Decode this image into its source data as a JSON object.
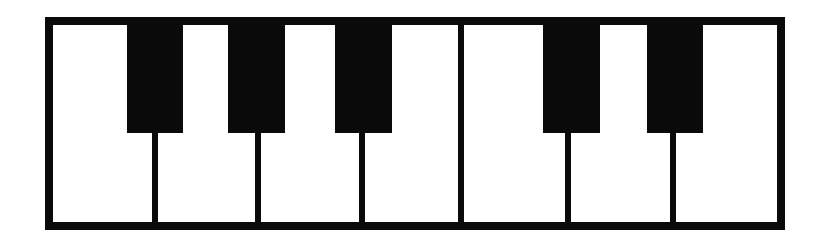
{
  "figure": {
    "name": "piano-keyboard-octave",
    "description": "Line drawing of one octave of a piano keyboard",
    "style": "black-and-white line art",
    "colors": {
      "key_black": "#0a0a0a",
      "key_white": "#ffffff",
      "background": "#ffffff"
    },
    "geometry": {
      "image_width": 820,
      "image_height": 243,
      "frame_left": 45,
      "frame_top": 17,
      "frame_width": 740,
      "frame_height": 213,
      "frame_border": 8,
      "inner_width": 724,
      "inner_height": 197,
      "black_key_height": 108,
      "divider_width": 6
    }
  },
  "keyboard": {
    "octave_count": 1,
    "white_key_count": 7,
    "black_key_count": 5,
    "white_keys": [
      {
        "note": "C",
        "left": 0,
        "width": 82,
        "label": "C"
      },
      {
        "note": "D",
        "left": 82,
        "width": 103,
        "label": "D"
      },
      {
        "note": "E",
        "left": 185,
        "width": 104,
        "label": "E"
      },
      {
        "note": "F",
        "left": 289,
        "width": 119,
        "label": "F"
      },
      {
        "note": "G",
        "left": 408,
        "width": 104,
        "label": "G"
      },
      {
        "note": "A",
        "left": 512,
        "width": 105,
        "label": "A"
      },
      {
        "note": "B",
        "left": 617,
        "width": 107,
        "label": "B"
      }
    ],
    "black_keys": [
      {
        "note": "C#",
        "left": 74,
        "width": 56,
        "label": "C♯/D♭"
      },
      {
        "note": "D#",
        "left": 175,
        "width": 57,
        "label": "D♯/E♭"
      },
      {
        "note": "F#",
        "left": 282,
        "width": 57,
        "label": "F♯/G♭"
      },
      {
        "note": "G#",
        "left": 490,
        "width": 57,
        "label": "G♯/A♭"
      },
      {
        "note": "A#",
        "left": 594,
        "width": 56,
        "label": "A♯/B♭"
      }
    ],
    "dividers": [
      {
        "between": "C-D",
        "left": 99,
        "type": "short"
      },
      {
        "between": "D-E",
        "left": 202,
        "type": "short"
      },
      {
        "between": "E-F",
        "left": 306,
        "type": "short"
      },
      {
        "between": "F-G",
        "left": 405,
        "type": "full"
      },
      {
        "between": "G-A",
        "left": 512,
        "type": "short"
      },
      {
        "between": "A-B",
        "left": 617,
        "type": "short"
      }
    ]
  }
}
